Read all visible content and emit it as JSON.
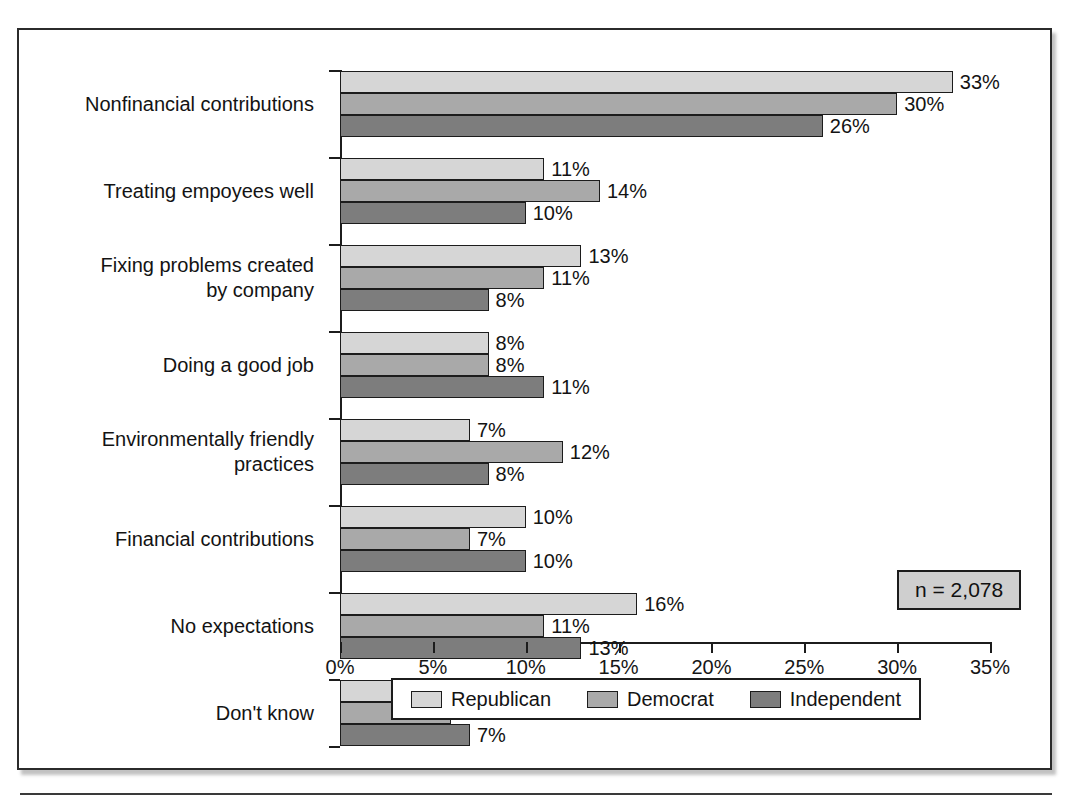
{
  "chart_data": {
    "type": "bar",
    "orientation": "horizontal",
    "title": "",
    "xlabel": "",
    "ylabel": "",
    "xlim": [
      0,
      35
    ],
    "xticks": [
      0,
      5,
      10,
      15,
      20,
      25,
      30,
      35
    ],
    "xtick_labels": [
      "0%",
      "5%",
      "10%",
      "15%",
      "20%",
      "25%",
      "30%",
      "35%"
    ],
    "grid": false,
    "legend_position": "bottom",
    "categories": [
      "Nonfinancial contributions",
      "Treating empoyees well",
      "Fixing problems created\nby company",
      "Doing a good job",
      "Environmentally friendly\npractices",
      "Financial contributions",
      "No expectations",
      "Don't know"
    ],
    "series": [
      {
        "name": "Republican",
        "color": "#d6d6d6",
        "values": [
          33,
          11,
          13,
          8,
          7,
          10,
          16,
          4
        ],
        "value_labels": [
          "33%",
          "11%",
          "13%",
          "8%",
          "7%",
          "10%",
          "16%",
          "4%"
        ]
      },
      {
        "name": "Democrat",
        "color": "#a9a9a9",
        "values": [
          30,
          14,
          11,
          8,
          12,
          7,
          11,
          6
        ],
        "value_labels": [
          "30%",
          "14%",
          "11%",
          "8%",
          "12%",
          "7%",
          "11%",
          "6%"
        ]
      },
      {
        "name": "Independent",
        "color": "#7d7d7d",
        "values": [
          26,
          10,
          8,
          11,
          8,
          10,
          13,
          7
        ],
        "value_labels": [
          "26%",
          "10%",
          "8%",
          "11%",
          "8%",
          "10%",
          "13%",
          "7%"
        ]
      }
    ],
    "annotations": [
      {
        "name": "sample-size",
        "text": "n = 2,078"
      }
    ]
  },
  "annotation_box": {
    "sample_size_label": "n = 2,078"
  }
}
